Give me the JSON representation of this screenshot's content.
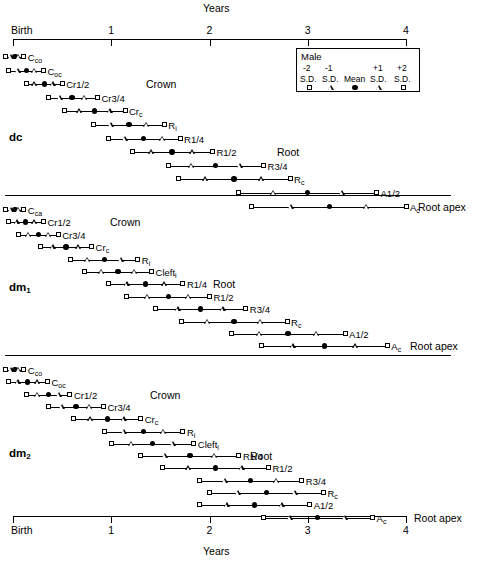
{
  "axis": {
    "title_top": "Years",
    "title_bottom": "Years",
    "ticks": [
      {
        "label": "Birth",
        "value": 0
      },
      {
        "label": "1",
        "value": 1
      },
      {
        "label": "2",
        "value": 2
      },
      {
        "label": "3",
        "value": 3
      },
      {
        "label": "4",
        "value": 4
      }
    ],
    "x_min": 0,
    "x_max": 4,
    "unit": "years"
  },
  "legend": {
    "title": "Male",
    "columns": [
      {
        "num": "-2",
        "sd": "S.D.",
        "symbol": "square"
      },
      {
        "num": "-1",
        "sd": "S.D.",
        "symbol": "triangle"
      },
      {
        "num": "",
        "sd": "Mean",
        "symbol": "circle"
      },
      {
        "num": "+1",
        "sd": "S.D.",
        "symbol": "triangle"
      },
      {
        "num": "+2",
        "sd": "S.D.",
        "symbol": "square"
      }
    ]
  },
  "group_labels": {
    "crown": "Crown",
    "root": "Root",
    "root_apex": "Root apex"
  },
  "chart_data": {
    "type": "range-plot",
    "xlabel": "Years",
    "ylabel": "",
    "xlim": [
      0,
      4
    ],
    "grid": false,
    "legend_position": "top-right",
    "legend_entries": [
      "-2 S.D.",
      "-1 S.D.",
      "Mean",
      "+1 S.D.",
      "+2 S.D."
    ],
    "marker_map": {
      "-2 S.D.": "square",
      "-1 S.D.": "triangle",
      "Mean": "filled-circle",
      "+1 S.D.": "triangle",
      "+2 S.D.": "square"
    },
    "series": [
      {
        "name": "dc",
        "tooth_label": "dc",
        "stages": [
          {
            "stage": "C<sub>co</sub>",
            "label": "Cco",
            "group": "Crown",
            "m2": -0.08,
            "m1": -0.02,
            "mean": 0.02,
            "p1": 0.06,
            "p2": 0.11
          },
          {
            "stage": "C<sub>oc</sub>",
            "label": "Coc",
            "group": "Crown",
            "m2": -0.05,
            "m1": 0.05,
            "mean": 0.14,
            "p1": 0.22,
            "p2": 0.31
          },
          {
            "stage": "Cr1/2",
            "label": "Cr1/2",
            "group": "Crown",
            "m2": 0.14,
            "m1": 0.22,
            "mean": 0.32,
            "p1": 0.41,
            "p2": 0.5
          },
          {
            "stage": "Cr3/4",
            "label": "Cr3/4",
            "group": "Crown",
            "m2": 0.36,
            "m1": 0.48,
            "mean": 0.6,
            "p1": 0.73,
            "p2": 0.86
          },
          {
            "stage": "Cr<sub>c</sub>",
            "label": "Crc",
            "group": "Crown",
            "m2": 0.52,
            "m1": 0.68,
            "mean": 0.83,
            "p1": 0.99,
            "p2": 1.14
          },
          {
            "stage": "R<sub>i</sub>",
            "label": "Ri",
            "group": "Root",
            "m2": 0.82,
            "m1": 1.0,
            "mean": 1.18,
            "p1": 1.36,
            "p2": 1.54
          },
          {
            "stage": "R1/4",
            "label": "R1/4",
            "group": "Root",
            "m2": 0.97,
            "m1": 1.14,
            "mean": 1.33,
            "p1": 1.52,
            "p2": 1.7
          },
          {
            "stage": "R1/2",
            "label": "R1/2",
            "group": "Root",
            "m2": 1.22,
            "m1": 1.41,
            "mean": 1.62,
            "p1": 1.83,
            "p2": 2.03
          },
          {
            "stage": "R3/4",
            "label": "R3/4",
            "group": "Root",
            "m2": 1.58,
            "m1": 1.82,
            "mean": 2.06,
            "p1": 2.31,
            "p2": 2.55
          },
          {
            "stage": "R<sub>c</sub>",
            "label": "Rc",
            "group": "Root",
            "m2": 1.68,
            "m1": 1.96,
            "mean": 2.25,
            "p1": 2.53,
            "p2": 2.82
          },
          {
            "stage": "A1/2",
            "label": "A1/2",
            "group": "Root apex",
            "m2": 2.3,
            "m1": 2.65,
            "mean": 3.0,
            "p1": 3.35,
            "p2": 3.7
          },
          {
            "stage": "A<sub>c</sub>",
            "label": "Ac",
            "group": "Root apex",
            "m2": 2.43,
            "m1": 2.83,
            "mean": 3.22,
            "p1": 3.6,
            "p2": 4.0
          }
        ]
      },
      {
        "name": "dm1",
        "tooth_label": "dm1",
        "stages": [
          {
            "stage": "C<sub>ca</sub>",
            "label": "Cca",
            "group": "Crown",
            "m2": -0.08,
            "m1": -0.02,
            "mean": 0.02,
            "p1": 0.06,
            "p2": 0.11
          },
          {
            "stage": "Cr1/2",
            "label": "Cr1/2",
            "group": "Crown",
            "m2": -0.05,
            "m1": 0.04,
            "mean": 0.13,
            "p1": 0.22,
            "p2": 0.31
          },
          {
            "stage": "Cr3/4",
            "label": "Cr3/4",
            "group": "Crown",
            "m2": 0.06,
            "m1": 0.16,
            "mean": 0.26,
            "p1": 0.36,
            "p2": 0.46
          },
          {
            "stage": "Cr<sub>c</sub>",
            "label": "Crc",
            "group": "Crown",
            "m2": 0.28,
            "m1": 0.41,
            "mean": 0.54,
            "p1": 0.67,
            "p2": 0.8
          },
          {
            "stage": "R<sub>i</sub>",
            "label": "Ri",
            "group": "Root",
            "m2": 0.59,
            "m1": 0.76,
            "mean": 0.93,
            "p1": 1.1,
            "p2": 1.27
          },
          {
            "stage": "Cleft<sub>i</sub>",
            "label": "Clefti",
            "group": "Root",
            "m2": 0.73,
            "m1": 0.9,
            "mean": 1.07,
            "p1": 1.24,
            "p2": 1.41
          },
          {
            "stage": "R1/4",
            "label": "R1/4",
            "group": "Root",
            "m2": 0.97,
            "m1": 1.16,
            "mean": 1.35,
            "p1": 1.54,
            "p2": 1.73
          },
          {
            "stage": "R1/2",
            "label": "R1/2",
            "group": "Root",
            "m2": 1.16,
            "m1": 1.37,
            "mean": 1.58,
            "p1": 1.79,
            "p2": 2.0
          },
          {
            "stage": "R3/4",
            "label": "R3/4",
            "group": "Root",
            "m2": 1.45,
            "m1": 1.68,
            "mean": 1.91,
            "p1": 2.14,
            "p2": 2.37
          },
          {
            "stage": "R<sub>c</sub>",
            "label": "Rc",
            "group": "Root",
            "m2": 1.71,
            "m1": 1.98,
            "mean": 2.25,
            "p1": 2.52,
            "p2": 2.79
          },
          {
            "stage": "A1/2",
            "label": "A1/2",
            "group": "Root apex",
            "m2": 2.22,
            "m1": 2.51,
            "mean": 2.8,
            "p1": 3.09,
            "p2": 3.38
          },
          {
            "stage": "A<sub>c</sub>",
            "label": "Ac",
            "group": "Root apex",
            "m2": 2.53,
            "m1": 2.85,
            "mean": 3.17,
            "p1": 3.49,
            "p2": 3.81
          }
        ]
      },
      {
        "name": "dm2",
        "tooth_label": "dm2",
        "stages": [
          {
            "stage": "C<sub>co</sub>",
            "label": "Cco",
            "group": "Crown",
            "m2": -0.08,
            "m1": -0.02,
            "mean": 0.02,
            "p1": 0.06,
            "p2": 0.11
          },
          {
            "stage": "C<sub>oc</sub>",
            "label": "Coc",
            "group": "Crown",
            "m2": -0.05,
            "m1": 0.05,
            "mean": 0.15,
            "p1": 0.25,
            "p2": 0.35
          },
          {
            "stage": "Cr1/2",
            "label": "Cr1/2",
            "group": "Crown",
            "m2": 0.14,
            "m1": 0.25,
            "mean": 0.36,
            "p1": 0.47,
            "p2": 0.58
          },
          {
            "stage": "Cr3/4",
            "label": "Cr3/4",
            "group": "Crown",
            "m2": 0.36,
            "m1": 0.5,
            "mean": 0.64,
            "p1": 0.78,
            "p2": 0.92
          },
          {
            "stage": "Cr<sub>c</sub>",
            "label": "Crc",
            "group": "Crown",
            "m2": 0.62,
            "m1": 0.79,
            "mean": 0.96,
            "p1": 1.13,
            "p2": 1.3
          },
          {
            "stage": "R<sub>i</sub>",
            "label": "Ri",
            "group": "Root",
            "m2": 0.93,
            "m1": 1.13,
            "mean": 1.33,
            "p1": 1.53,
            "p2": 1.73
          },
          {
            "stage": "Cleft<sub>i</sub>",
            "label": "Clefti",
            "group": "Root",
            "m2": 1.0,
            "m1": 1.21,
            "mean": 1.42,
            "p1": 1.63,
            "p2": 1.84
          },
          {
            "stage": "R1/4",
            "label": "R1/4",
            "group": "Root",
            "m2": 1.3,
            "m1": 1.55,
            "mean": 1.8,
            "p1": 2.05,
            "p2": 2.3
          },
          {
            "stage": "R1/2",
            "label": "R1/2",
            "group": "Root",
            "m2": 1.52,
            "m1": 1.79,
            "mean": 2.06,
            "p1": 2.33,
            "p2": 2.6
          },
          {
            "stage": "R3/4",
            "label": "R3/4",
            "group": "Root",
            "m2": 1.9,
            "m1": 2.16,
            "mean": 2.42,
            "p1": 2.68,
            "p2": 2.94
          },
          {
            "stage": "R<sub>c</sub>",
            "label": "Rc",
            "group": "Root",
            "m2": 2.0,
            "m1": 2.29,
            "mean": 2.58,
            "p1": 2.87,
            "p2": 3.16
          },
          {
            "stage": "A1/2",
            "label": "A1/2",
            "group": "Root apex",
            "m2": 1.9,
            "m1": 2.18,
            "mean": 2.46,
            "p1": 2.74,
            "p2": 3.02
          },
          {
            "stage": "A<sub>c</sub>",
            "label": "Ac",
            "group": "Root apex",
            "m2": 2.55,
            "m1": 2.82,
            "mean": 3.1,
            "p1": 3.38,
            "p2": 3.66
          }
        ]
      }
    ]
  }
}
